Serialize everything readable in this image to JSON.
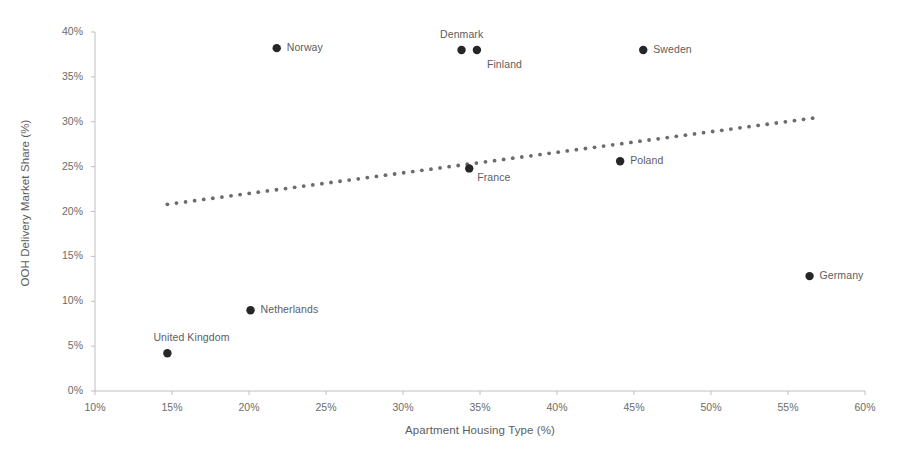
{
  "chart_data": {
    "type": "scatter",
    "title": "",
    "xlabel": "Apartment Housing Type (%)",
    "ylabel": "OOH Delivery Market Share (%)",
    "xlim": [
      10,
      60
    ],
    "ylim": [
      0,
      40
    ],
    "xticks": [
      "10%",
      "15%",
      "20%",
      "25%",
      "30%",
      "35%",
      "40%",
      "45%",
      "50%",
      "55%",
      "60%"
    ],
    "yticks": [
      "0%",
      "5%",
      "10%",
      "15%",
      "20%",
      "25%",
      "30%",
      "35%",
      "40%"
    ],
    "xtick_values": [
      10,
      15,
      20,
      25,
      30,
      35,
      40,
      45,
      50,
      55,
      60
    ],
    "ytick_values": [
      0,
      5,
      10,
      15,
      20,
      25,
      30,
      35,
      40
    ],
    "grid": false,
    "legend": "none",
    "marker_color": "#262626",
    "trendline_color": "#6b6b6b",
    "axis_color": "#bfbfbf",
    "points": [
      {
        "label": "Norway",
        "x": 21.8,
        "y": 38.2,
        "label_pos": "right"
      },
      {
        "label": "Denmark",
        "x": 33.8,
        "y": 38.0,
        "label_pos": "above"
      },
      {
        "label": "Finland",
        "x": 34.8,
        "y": 38.0,
        "label_pos": "below-right"
      },
      {
        "label": "Sweden",
        "x": 45.6,
        "y": 38.0,
        "label_pos": "right"
      },
      {
        "label": "Poland",
        "x": 44.1,
        "y": 25.6,
        "label_pos": "right"
      },
      {
        "label": "France",
        "x": 34.3,
        "y": 24.8,
        "label_pos": "right-low"
      },
      {
        "label": "Germany",
        "x": 56.4,
        "y": 12.8,
        "label_pos": "right"
      },
      {
        "label": "Netherlands",
        "x": 20.1,
        "y": 9.0,
        "label_pos": "right"
      },
      {
        "label": "United Kingdom",
        "x": 14.7,
        "y": 4.2,
        "label_pos": "above-left"
      }
    ],
    "trendline": {
      "style": "dotted",
      "x_start": 14.7,
      "y_start": 20.8,
      "x_end": 56.6,
      "y_end": 30.4
    }
  }
}
